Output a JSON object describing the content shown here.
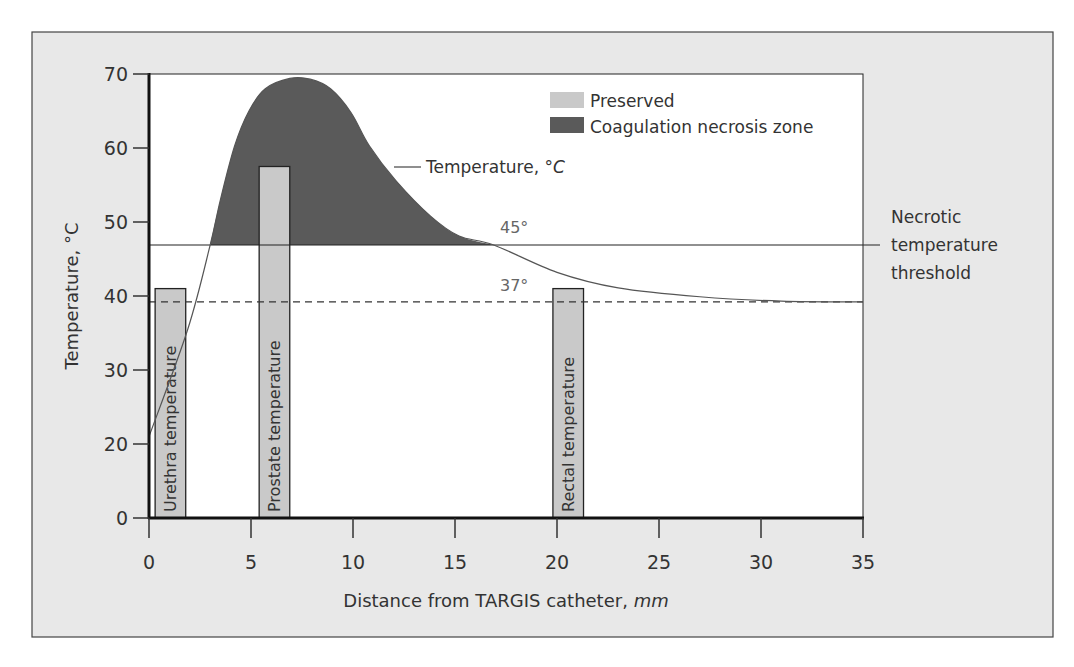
{
  "chart_data": {
    "type": "line",
    "title": "",
    "xlabel": "Distance from TARGIS catheter,",
    "xlabel_unit": "mm",
    "ylabel": "Temperature, °C",
    "xlim": [
      0,
      35
    ],
    "ylim": [
      0,
      70
    ],
    "y_axis_break": "compressed between 0 and 20",
    "grid": false,
    "x_ticks": [
      0,
      5,
      10,
      15,
      20,
      25,
      30,
      35
    ],
    "y_ticks": [
      0,
      20,
      30,
      40,
      50,
      60,
      70
    ],
    "legend": {
      "placement": "top-right",
      "entries": [
        {
          "label": "Preserved",
          "color": "#c9c9c9"
        },
        {
          "label": "Coagulation necrosis zone",
          "color": "#5a5a5a"
        }
      ]
    },
    "series": [
      {
        "name": "Temperature, °C",
        "label_prefix": "Temperature, °",
        "label_unit": "C",
        "x": [
          0,
          1.9,
          3.0,
          3.5,
          4.2,
          4.9,
          5.7,
          6.9,
          7.9,
          8.9,
          9.9,
          10.8,
          12.1,
          13.8,
          15.2,
          16.9,
          20.0,
          23.0,
          27.0,
          31.0,
          35.0
        ],
        "y": [
          21,
          35.5,
          46.9,
          53,
          60.3,
          65,
          68,
          69.4,
          69.3,
          68,
          64.8,
          60.3,
          55.6,
          50.8,
          48.1,
          46.9,
          43.2,
          41.1,
          39.9,
          39.3,
          39.2
        ]
      }
    ],
    "bars": [
      {
        "label": "Urethra temperature",
        "x_start": 0.3,
        "x_end": 1.8,
        "value": 41
      },
      {
        "label": "Prostate temperature",
        "x_start": 5.4,
        "x_end": 6.9,
        "value": 57.5
      },
      {
        "label": "Rectal temperature",
        "x_start": 19.8,
        "x_end": 21.3,
        "value": 41
      }
    ],
    "reference_lines": [
      {
        "label": "45°",
        "plotted_y": 46.9,
        "style": "solid",
        "side_label": [
          "Necrotic",
          "temperature",
          "threshold"
        ]
      },
      {
        "label": "37°",
        "plotted_y": 39.2,
        "style": "dashed"
      }
    ],
    "shaded_region": {
      "name": "Coagulation necrosis zone",
      "description": "area under temperature curve above necrotic threshold",
      "x_range": [
        3.0,
        16.9
      ]
    }
  }
}
